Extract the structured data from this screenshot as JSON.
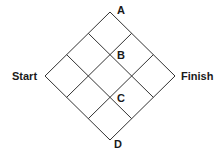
{
  "diagram": {
    "type": "rotated square grid",
    "grid_size": 3,
    "line_color": "#333333",
    "labels": {
      "start": "Start",
      "finish": "Finish",
      "a": "A",
      "b": "B",
      "c": "C",
      "d": "D"
    }
  }
}
